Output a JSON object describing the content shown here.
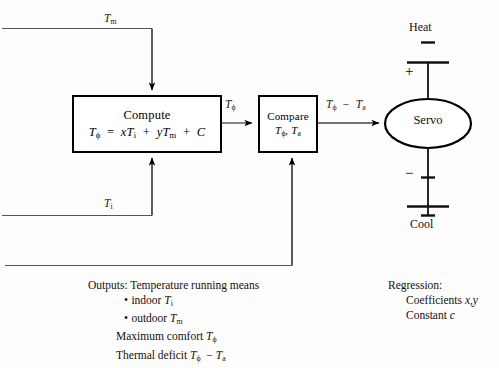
{
  "diagram": {
    "blocks": {
      "compute": {
        "name": "Compute",
        "formula_lhs": "T",
        "formula_lhs_sub": "ϕ",
        "formula_rhs": "= xT",
        "formula_full": "Tϕ = xTi + yTm + C"
      },
      "compare": {
        "name": "Compare",
        "args": "Tϕ, Ta"
      },
      "servo": {
        "name": "Servo"
      }
    },
    "signals": {
      "outdoor_input": "Tm",
      "indoor_input": "Ti",
      "compute_output": "Tϕ",
      "compare_output": "Tϕ − Ta"
    },
    "terminals": {
      "heat": "Heat",
      "cool": "Cool",
      "plus": "+",
      "minus": "−"
    }
  },
  "notes": {
    "outputs": {
      "heading": "Outputs:",
      "line1": "Temperature running means",
      "bullet1_marker": "•",
      "bullet1": "indoor Ti",
      "bullet2_marker": "•",
      "bullet2": "outdoor Tm",
      "line4": "Maximum comfort Tϕ",
      "line5": "Thermal deficit Tϕ − Ta"
    },
    "regression": {
      "heading": "Regression:",
      "line1": "Coefficients x,y",
      "line2": "Constant c"
    }
  },
  "colors": {
    "line": "#000000",
    "text": "#111111",
    "background": "#fdfdfd"
  }
}
